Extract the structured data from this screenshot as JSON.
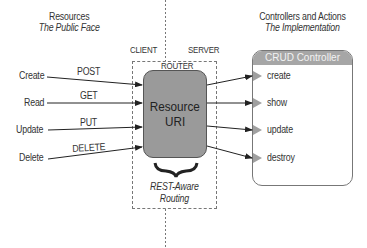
{
  "left_heading": {
    "title": "Resources",
    "subtitle": "The Public Face"
  },
  "right_heading": {
    "title": "Controllers and Actions",
    "subtitle": "The Implementation"
  },
  "zones": {
    "client": "CLIENT",
    "server": "SERVER",
    "router": "ROUTER"
  },
  "resource": {
    "line1": "Resource",
    "line2": "URI"
  },
  "routing_label": {
    "line1": "REST-Aware",
    "line2": "Routing"
  },
  "operations": [
    {
      "name": "Create",
      "verb": "POST"
    },
    {
      "name": "Read",
      "verb": "GET"
    },
    {
      "name": "Update",
      "verb": "PUT"
    },
    {
      "name": "Delete",
      "verb": "DELETE"
    }
  ],
  "controller": {
    "title": "CRUD Controller",
    "actions": [
      "create",
      "show",
      "update",
      "destroy"
    ]
  },
  "colors": {
    "resource_fill": "#9a9a9a",
    "controller_header": "#a6a6a6",
    "arrow": "#222222",
    "marker": "#a0a0a0"
  }
}
